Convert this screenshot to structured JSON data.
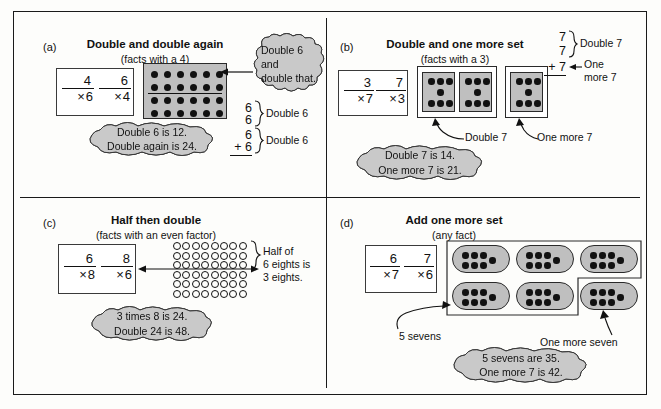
{
  "figure": {
    "quadrants": [
      {
        "key": "a",
        "label": "(a)",
        "title": "Double and double again",
        "subtitle": "(facts with a 4)",
        "facts": [
          {
            "top": "4",
            "op": "×",
            "bottom": "6"
          },
          {
            "top": "6",
            "op": "×",
            "bottom": "4"
          }
        ],
        "array": {
          "rows": 4,
          "cols": 6,
          "split_after_row": 2,
          "dot_style": "filled"
        },
        "callout": {
          "lines": [
            "Double 6",
            "and",
            "double that."
          ],
          "align": "left"
        },
        "result_cloud": {
          "lines": [
            "Double 6 is 12.",
            "Double again is 24."
          ]
        },
        "column": {
          "groups": [
            {
              "addends": [
                "6",
                "6"
              ],
              "brace_label": "Double 6"
            },
            {
              "addends": [
                "6",
                "+ 6"
              ],
              "brace_label": "Double 6"
            }
          ]
        }
      },
      {
        "key": "b",
        "label": "(b)",
        "title": "Double and one more set",
        "subtitle": "(facts with a 3)",
        "facts": [
          {
            "top": "3",
            "op": "×",
            "bottom": "7"
          },
          {
            "top": "7",
            "op": "×",
            "bottom": "3"
          }
        ],
        "sets": {
          "grouped_count": 2,
          "extra_count": 1,
          "dots_per_set": 7,
          "pattern": "3-1-3"
        },
        "annotations": [
          {
            "text": "Double 7",
            "points_to": "grouped-sets"
          },
          {
            "text": "One more 7",
            "points_to": "extra-set"
          }
        ],
        "result_cloud": {
          "lines": [
            "Double 7 is 14.",
            "One more 7 is 21."
          ]
        },
        "column": {
          "addends": [
            "7",
            "7",
            "+ 7"
          ],
          "brace_label": "Double 7",
          "arrow_label": [
            "One",
            "more 7"
          ]
        }
      },
      {
        "key": "c",
        "label": "(c)",
        "title": "Half then double",
        "subtitle": "(facts with an even factor)",
        "facts": [
          {
            "top": "6",
            "op": "×",
            "bottom": "8"
          },
          {
            "top": "8",
            "op": "×",
            "bottom": "6"
          }
        ],
        "array": {
          "rows": 6,
          "cols": 8,
          "split_after_row": 3,
          "dot_style": "open"
        },
        "brace_note": {
          "lines": [
            "Half of",
            "6 eights is",
            "3 eights."
          ]
        },
        "result_cloud": {
          "lines": [
            "3 times 8 is 24.",
            "Double 24 is 48."
          ]
        }
      },
      {
        "key": "d",
        "label": "(d)",
        "title": "Add one more set",
        "subtitle": "(any fact)",
        "facts": [
          {
            "top": "6",
            "op": "×",
            "bottom": "7"
          },
          {
            "top": "7",
            "op": "×",
            "bottom": "6"
          }
        ],
        "sets": {
          "grouped_count": 5,
          "extra_count": 1,
          "dots_per_set": 7,
          "pattern": "3x2+1"
        },
        "annotations": [
          {
            "text": "5 sevens",
            "points_to": "grouped-sets"
          },
          {
            "text": "One more seven",
            "points_to": "extra-set"
          }
        ],
        "result_cloud": {
          "lines": [
            "5 sevens are 35.",
            "One more 7 is 42."
          ]
        }
      }
    ]
  },
  "colors": {
    "cloud_fill": "#c9c9c9",
    "panel_fill": "#bfbfbf",
    "dot_fill": "#111111",
    "stroke": "#1a1a1a",
    "page_bg": "#fdfdfb"
  }
}
